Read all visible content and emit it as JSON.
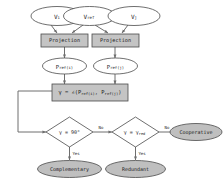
{
  "diagram": {
    "colors": {
      "fill_white": "#ffffff",
      "fill_gray": "#bfbfbf",
      "fill_gray_box": "#c4c4c4",
      "stroke": "#4a4a4a",
      "connector": "#6e6e6e",
      "text": "#1c1c1c",
      "background": "#ffffff"
    },
    "inputs": [
      {
        "id": "v-i",
        "label": "V",
        "sub": "i",
        "shape": "ellipse",
        "fill": "white"
      },
      {
        "id": "v-ref",
        "label": "V",
        "sub": "ref",
        "shape": "ellipse",
        "fill": "white"
      },
      {
        "id": "v-j",
        "label": "V",
        "sub": "j",
        "shape": "ellipse",
        "fill": "white"
      }
    ],
    "processes": [
      {
        "id": "projection-left",
        "label": "Projection",
        "shape": "rect",
        "fill": "gray"
      },
      {
        "id": "projection-right",
        "label": "Projection",
        "shape": "rect",
        "fill": "gray"
      }
    ],
    "projections": [
      {
        "id": "p-ref-i",
        "label": "P",
        "sub": "ref",
        "arg": "(i)",
        "shape": "ellipse",
        "fill": "white"
      },
      {
        "id": "p-ref-j",
        "label": "P",
        "sub": "ref",
        "arg": "(j)",
        "shape": "ellipse",
        "fill": "white"
      }
    ],
    "formula": {
      "id": "angle-formula",
      "text": "γ = ∠(P",
      "sub1": "ref(i)",
      "mid": ", P",
      "sub2": "ref(j)",
      "tail": ")",
      "shape": "rect",
      "fill": "gray"
    },
    "decisions": [
      {
        "id": "decision-orthogonal",
        "label": "γ = 90°",
        "shape": "diamond",
        "fill": "white"
      },
      {
        "id": "decision-redundant",
        "label": "γ = γ",
        "sub": "red",
        "shape": "diamond",
        "fill": "white"
      }
    ],
    "outcomes": [
      {
        "id": "outcome-complementary",
        "label": "Complementary",
        "shape": "ellipse",
        "fill": "gray"
      },
      {
        "id": "outcome-redundant",
        "label": "Redundant",
        "shape": "ellipse",
        "fill": "gray"
      },
      {
        "id": "outcome-cooperative",
        "label": "Cooperative",
        "shape": "ellipse",
        "fill": "gray"
      }
    ],
    "edge_labels": {
      "no_1": "No",
      "no_2": "No",
      "yes_1": "Yes",
      "yes_2": "Yes"
    }
  }
}
